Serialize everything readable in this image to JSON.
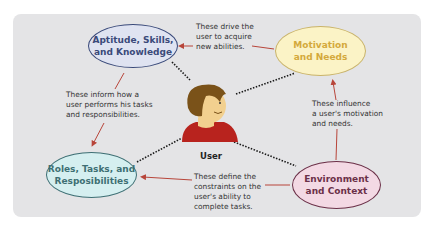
{
  "diagram": {
    "center": {
      "label": "User"
    },
    "nodes": [
      {
        "id": "aptitude",
        "label_line1": "Aptitude, Skills,",
        "label_line2": "and Knowledge",
        "fill": "#dfe3f1",
        "border": "#3a4a7a",
        "text_color": "#3a4a7a"
      },
      {
        "id": "motivation",
        "label_line1": "Motivation",
        "label_line2": "and Needs",
        "fill": "#fbf3c6",
        "border": "#c9b36a",
        "text_color": "#d4a93c"
      },
      {
        "id": "roles",
        "label_line1": "Roles, Tasks, and",
        "label_line2": "Resposibilities",
        "fill": "#d5eff0",
        "border": "#3e6f74",
        "text_color": "#3e6f74"
      },
      {
        "id": "environment",
        "label_line1": "Environment",
        "label_line2": "and Context",
        "fill": "#f3d9e4",
        "border": "#6b3048",
        "text_color": "#6b3048"
      }
    ],
    "notes": [
      {
        "id": "drive",
        "lines": [
          "These drive the",
          "user to acquire",
          "new abilities."
        ]
      },
      {
        "id": "inform",
        "lines": [
          "These inform how a",
          "user performs his tasks",
          "and responsibilities."
        ]
      },
      {
        "id": "influence",
        "lines": [
          "These influence",
          "a user's motivation",
          "and needs."
        ]
      },
      {
        "id": "define",
        "lines": [
          "These define the",
          "constraints on the",
          "user's ability to",
          "complete tasks."
        ]
      }
    ],
    "arrow_color": "#b8453a",
    "dotted_color": "#1a1a1a"
  }
}
